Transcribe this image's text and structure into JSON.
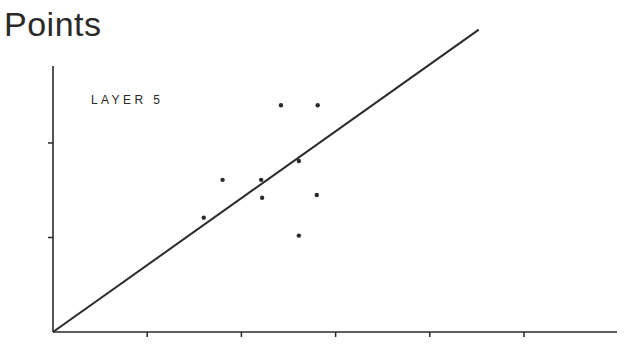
{
  "title": "Points",
  "chart_data": {
    "type": "scatter",
    "title": "Points",
    "annotation": "LAYER 5",
    "xlabel": "",
    "ylabel": "",
    "xlim": [
      0,
      6
    ],
    "ylim": [
      0,
      2.8
    ],
    "x_ticks": [
      1,
      2,
      3,
      4,
      5
    ],
    "y_ticks": [
      1,
      2
    ],
    "tick_labels_shown": false,
    "grid": false,
    "legend": null,
    "series": [
      {
        "name": "Layer 5 points",
        "type": "scatter",
        "points": [
          {
            "x": 1.6,
            "y": 1.21
          },
          {
            "x": 1.8,
            "y": 1.61
          },
          {
            "x": 2.21,
            "y": 1.61
          },
          {
            "x": 2.22,
            "y": 1.42
          },
          {
            "x": 2.42,
            "y": 2.4
          },
          {
            "x": 2.61,
            "y": 1.81
          },
          {
            "x": 2.81,
            "y": 2.4
          },
          {
            "x": 2.8,
            "y": 1.45
          },
          {
            "x": 2.61,
            "y": 1.02
          }
        ]
      },
      {
        "name": "Reference line",
        "type": "line",
        "points": [
          {
            "x": 0,
            "y": 0
          },
          {
            "x": 4.52,
            "y": 3.2
          }
        ]
      }
    ]
  },
  "colors": {
    "ink": "#2a2a2a",
    "background": "#ffffff"
  }
}
